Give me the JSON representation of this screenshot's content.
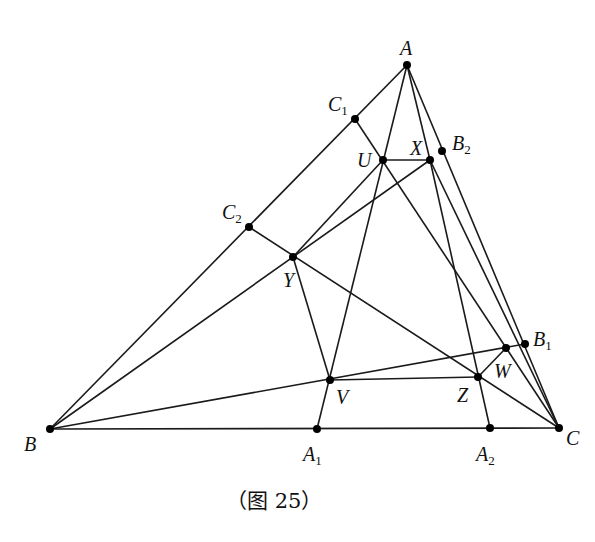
{
  "figure": {
    "caption": "（图 25）",
    "stroke_color": "#1a1a1a",
    "point_color": "#000000"
  },
  "points": [
    {
      "id": "A",
      "label": "A",
      "sub": "",
      "x": 407,
      "y": 65,
      "lx": 400,
      "ly": 38
    },
    {
      "id": "B",
      "label": "B",
      "sub": "",
      "x": 50,
      "y": 429,
      "lx": 24,
      "ly": 434
    },
    {
      "id": "C",
      "label": "C",
      "sub": "",
      "x": 559,
      "y": 428,
      "lx": 566,
      "ly": 428
    },
    {
      "id": "C1",
      "label": "C",
      "sub": "1",
      "x": 355,
      "y": 119,
      "lx": 328,
      "ly": 94
    },
    {
      "id": "C2",
      "label": "C",
      "sub": "2",
      "x": 249,
      "y": 227,
      "lx": 222,
      "ly": 202
    },
    {
      "id": "B1",
      "label": "B",
      "sub": "1",
      "x": 525,
      "y": 344,
      "lx": 533,
      "ly": 329
    },
    {
      "id": "B2",
      "label": "B",
      "sub": "2",
      "x": 442,
      "y": 151,
      "lx": 452,
      "ly": 133
    },
    {
      "id": "A1",
      "label": "A",
      "sub": "1",
      "x": 317,
      "y": 429,
      "lx": 303,
      "ly": 444
    },
    {
      "id": "A2",
      "label": "A",
      "sub": "2",
      "x": 490,
      "y": 428,
      "lx": 476,
      "ly": 444
    },
    {
      "id": "U",
      "label": "U",
      "sub": "",
      "x": 383,
      "y": 160,
      "lx": 357,
      "ly": 150
    },
    {
      "id": "X",
      "label": "X",
      "sub": "",
      "x": 430,
      "y": 160,
      "lx": 410,
      "ly": 138
    },
    {
      "id": "Y",
      "label": "Y",
      "sub": "",
      "x": 293,
      "y": 257,
      "lx": 283,
      "ly": 270
    },
    {
      "id": "V",
      "label": "V",
      "sub": "",
      "x": 330,
      "y": 380,
      "lx": 336,
      "ly": 387
    },
    {
      "id": "Z",
      "label": "Z",
      "sub": "",
      "x": 478,
      "y": 377,
      "lx": 457,
      "ly": 385
    },
    {
      "id": "W",
      "label": "W",
      "sub": "",
      "x": 506,
      "y": 348,
      "lx": 494,
      "ly": 361
    }
  ],
  "segments": [
    [
      "A",
      "B"
    ],
    [
      "B",
      "C"
    ],
    [
      "A",
      "C"
    ],
    [
      "A",
      "A1"
    ],
    [
      "A",
      "X"
    ],
    [
      "X",
      "A2"
    ],
    [
      "C1",
      "C"
    ],
    [
      "C2",
      "C"
    ],
    [
      "B",
      "X"
    ],
    [
      "B",
      "B1"
    ],
    [
      "U",
      "X"
    ],
    [
      "U",
      "Y"
    ],
    [
      "Y",
      "V"
    ],
    [
      "V",
      "Z"
    ],
    [
      "Z",
      "W"
    ],
    [
      "X",
      "C"
    ]
  ]
}
